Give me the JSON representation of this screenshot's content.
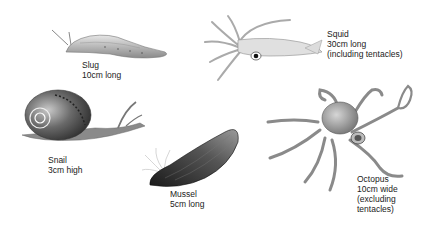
{
  "figure": {
    "animals": [
      {
        "name": "Slug",
        "lines": [
          "Slug",
          "10cm long"
        ]
      },
      {
        "name": "Squid",
        "lines": [
          "Squid",
          "30cm long",
          "(including tentacles)"
        ]
      },
      {
        "name": "Snail",
        "lines": [
          "Snail",
          "3cm high"
        ]
      },
      {
        "name": "Mussel",
        "lines": [
          "Mussel",
          "5cm long"
        ]
      },
      {
        "name": "Octopus",
        "lines": [
          "Octopus",
          "10cm wide",
          "(excluding",
          "tentacles)"
        ]
      }
    ]
  }
}
